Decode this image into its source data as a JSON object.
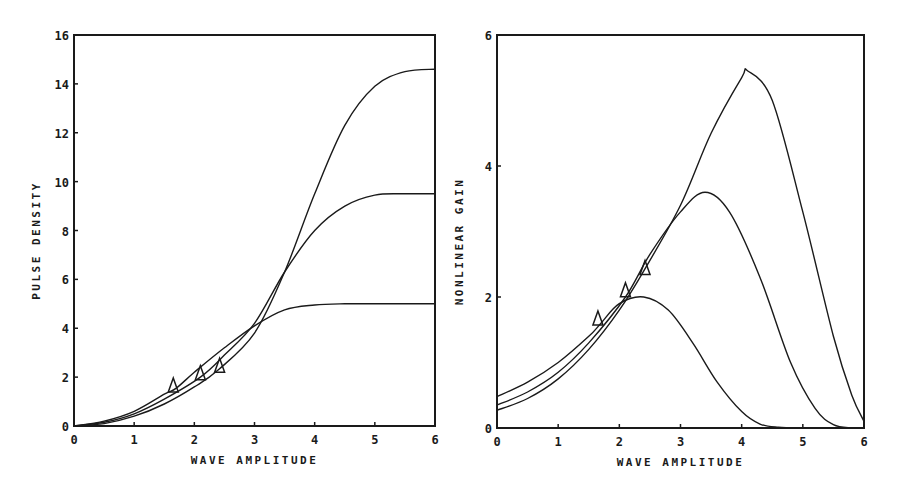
{
  "chart_data": [
    {
      "type": "line",
      "title": "",
      "xlabel": "WAVE AMPLITUDE",
      "ylabel": "PULSE DENSITY",
      "xlim": [
        0,
        6
      ],
      "ylim": [
        0,
        16
      ],
      "xticks": [
        0,
        1,
        2,
        3,
        4,
        5,
        6
      ],
      "yticks": [
        0,
        2,
        4,
        6,
        8,
        10,
        12,
        14,
        16
      ],
      "grid": false,
      "legend": null,
      "series": [
        {
          "name": "curve-low",
          "x": [
            0,
            0.5,
            1,
            1.5,
            1.7,
            2,
            2.5,
            3,
            3.5,
            4,
            4.5,
            5,
            6
          ],
          "y": [
            0,
            0.2,
            0.6,
            1.3,
            1.55,
            2.2,
            3.2,
            4.1,
            4.75,
            4.95,
            5.0,
            5.0,
            5.0
          ]
        },
        {
          "name": "curve-mid",
          "x": [
            0,
            0.5,
            1,
            1.5,
            2.1,
            2.5,
            3,
            3.5,
            4,
            4.5,
            5,
            5.5,
            6
          ],
          "y": [
            0,
            0.15,
            0.5,
            1.1,
            2.0,
            2.9,
            4.2,
            6.3,
            8.0,
            9.0,
            9.45,
            9.5,
            9.5
          ]
        },
        {
          "name": "curve-high",
          "x": [
            0,
            0.5,
            1,
            1.5,
            2,
            2.4,
            3,
            3.5,
            4,
            4.5,
            5,
            5.5,
            6
          ],
          "y": [
            0,
            0.1,
            0.4,
            0.9,
            1.6,
            2.3,
            3.8,
            6.3,
            9.5,
            12.3,
            13.9,
            14.5,
            14.6
          ]
        }
      ],
      "markers": [
        {
          "symbol": "triangle",
          "x": 1.65,
          "y": 1.6
        },
        {
          "symbol": "triangle",
          "x": 2.1,
          "y": 2.1
        },
        {
          "symbol": "triangle",
          "x": 2.42,
          "y": 2.4
        }
      ]
    },
    {
      "type": "line",
      "title": "",
      "xlabel": "WAVE AMPLITUDE",
      "ylabel": "NONLINEAR GAIN",
      "xlim": [
        0,
        6
      ],
      "ylim": [
        0,
        6
      ],
      "xticks": [
        0,
        1,
        2,
        3,
        4,
        5,
        6
      ],
      "yticks": [
        0,
        2,
        4,
        6
      ],
      "grid": false,
      "legend": null,
      "series": [
        {
          "name": "gain-low",
          "x": [
            0,
            0.5,
            1,
            1.5,
            1.7,
            2,
            2.4,
            2.8,
            3.2,
            3.6,
            4,
            4.3,
            4.6,
            5,
            6
          ],
          "y": [
            0.48,
            0.7,
            1.0,
            1.4,
            1.6,
            1.9,
            2.0,
            1.8,
            1.3,
            0.7,
            0.25,
            0.06,
            0.01,
            0,
            0
          ]
        },
        {
          "name": "gain-mid",
          "x": [
            0,
            0.5,
            1,
            1.5,
            2.1,
            2.5,
            3,
            3.4,
            3.8,
            4.3,
            4.8,
            5.2,
            5.5,
            5.8,
            6
          ],
          "y": [
            0.35,
            0.55,
            0.85,
            1.3,
            2.0,
            2.65,
            3.3,
            3.6,
            3.3,
            2.3,
            1.0,
            0.3,
            0.05,
            0,
            0
          ]
        },
        {
          "name": "gain-high",
          "x": [
            0,
            0.5,
            1,
            1.5,
            2,
            2.4,
            3,
            3.5,
            4,
            4.1,
            4.5,
            5,
            5.5,
            5.8,
            6
          ],
          "y": [
            0.27,
            0.45,
            0.75,
            1.2,
            1.8,
            2.4,
            3.4,
            4.5,
            5.35,
            5.45,
            5.0,
            3.3,
            1.4,
            0.5,
            0.1
          ]
        }
      ],
      "markers": [
        {
          "symbol": "triangle",
          "x": 1.65,
          "y": 1.65
        },
        {
          "symbol": "triangle",
          "x": 2.1,
          "y": 2.08
        },
        {
          "symbol": "triangle",
          "x": 2.42,
          "y": 2.42
        }
      ]
    }
  ],
  "layout": {
    "panels": [
      {
        "left": 74,
        "right": 435,
        "top": 35,
        "bottom": 426
      },
      {
        "left": 497,
        "right": 864,
        "top": 35,
        "bottom": 428
      }
    ]
  }
}
